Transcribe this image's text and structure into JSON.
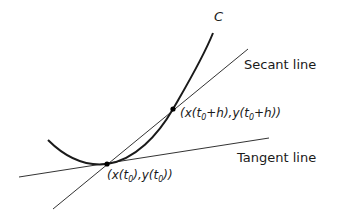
{
  "diagram": {
    "curve": {
      "label": "C",
      "color": "#1a1a1a"
    },
    "lines": {
      "secant": {
        "label": "Secant line",
        "color": "#333333"
      },
      "tangent": {
        "label": "Tangent line",
        "color": "#333333"
      }
    },
    "points": [
      {
        "name": "p0",
        "label_prefix": "(x(t",
        "sub1": "0",
        "label_mid": "),y(t",
        "sub2": "0",
        "label_suffix": "))",
        "full_label": "(x(t0),y(t0))"
      },
      {
        "name": "p1",
        "label_prefix": "(x(t",
        "sub1": "0",
        "label_mid": "+h),y(t",
        "sub2": "0",
        "label_suffix": "+h))",
        "full_label": "(x(t0+h),y(t0+h))"
      }
    ]
  }
}
